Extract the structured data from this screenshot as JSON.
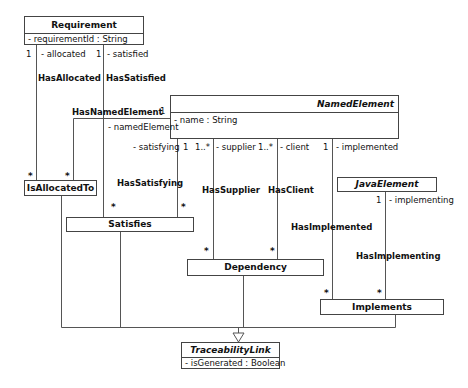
{
  "classes": {
    "requirement": {
      "name": "Requirement",
      "attributes": [
        "- requirementId : String"
      ],
      "abstract": false
    },
    "named_element": {
      "name": "NamedElement",
      "attributes": [
        "- name : String"
      ],
      "abstract": true
    },
    "is_allocated_to": {
      "name": "IsAllocatedTo",
      "attributes": [],
      "abstract": false
    },
    "satisfies": {
      "name": "Satisfies",
      "attributes": [],
      "abstract": false
    },
    "dependency": {
      "name": "Dependency",
      "attributes": [],
      "abstract": false
    },
    "java_element": {
      "name": "JavaElement",
      "attributes": [],
      "abstract": true
    },
    "implements": {
      "name": "Implements",
      "attributes": [],
      "abstract": false
    },
    "traceability_link": {
      "name": "TraceabilityLink",
      "attributes": [
        "- isGenerated : Boolean"
      ],
      "abstract": true
    }
  },
  "associations": {
    "has_allocated": {
      "name": "HasAllocated",
      "source_mult": "1",
      "role": "- allocated",
      "target_mult": "*"
    },
    "has_satisfied": {
      "name": "HasSatisfied",
      "source_mult": "1",
      "role": "- satisfied",
      "target_mult": "*"
    },
    "has_named_element": {
      "name": "HasNamedElement",
      "source_mult": "1",
      "role": "- namedElement",
      "target_mult": "*"
    },
    "has_satisfying": {
      "name": "HasSatisfying",
      "source_mult": "1",
      "role": "- satisfying",
      "target_mult": "*"
    },
    "has_supplier": {
      "name": "HasSupplier",
      "source_mult": "1..*",
      "role": "- supplier",
      "target_mult": "*"
    },
    "has_client": {
      "name": "HasClient",
      "source_mult": "1..*",
      "role": "- client",
      "target_mult": "*"
    },
    "has_implemented": {
      "name": "HasImplemented",
      "source_mult": "1",
      "role": "- implemented",
      "target_mult": "*"
    },
    "has_implementing": {
      "name": "HasImplementing",
      "source_mult": "1",
      "role": "- implementing",
      "target_mult": "*"
    }
  },
  "generalization": {
    "parent": "TraceabilityLink",
    "children": [
      "IsAllocatedTo",
      "Satisfies",
      "Dependency",
      "Implements"
    ]
  }
}
